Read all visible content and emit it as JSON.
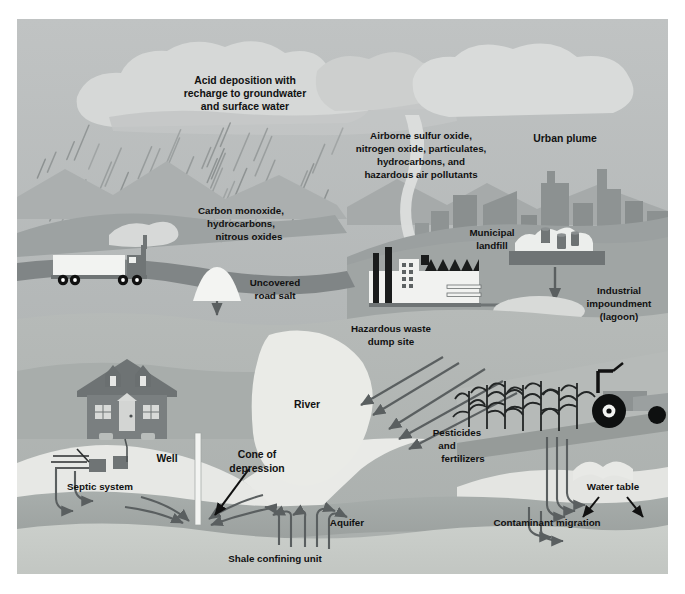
{
  "figure": {
    "border_color": "#ffffff"
  },
  "palette": {
    "sky": "#b9bcbd",
    "cloud_light": "#d5d7d6",
    "cloud_mid": "#c6c8c8",
    "mountain_far": "#a9adad",
    "mountain_mid": "#9ea2a2",
    "mountain_near": "#8f9494",
    "city_building": "#8d9292",
    "city_haze": "#d9dbda",
    "ground_surface": "#9aa09f",
    "unsaturated_zone": "#b0b5b3",
    "vadose_light": "#c3c7c5",
    "aquifer": "#a2a8a6",
    "aquifer_deep": "#949a99",
    "shale": "#c9cdc9",
    "white_feature": "#f2f3f1",
    "road": "#7f8485",
    "river": "#e9eae6",
    "arrow": "#5a5f60",
    "arrow_black": "#111111",
    "text": "#111111",
    "structure_dark": "#6f7475"
  },
  "labels": {
    "acid_deposition": [
      "Acid deposition with",
      "recharge to groundwater",
      "and surface water"
    ],
    "airborne": [
      "Airborne sulfur oxide,",
      "nitrogen oxide, particulates,",
      "hydrocarbons, and",
      "hazardous air pollutants"
    ],
    "urban_plume": "Urban plume",
    "vehicle_emissions": [
      "Carbon monoxide,",
      "hydrocarbons,",
      "nitrous oxides"
    ],
    "road_salt": [
      "Uncovered",
      "road salt"
    ],
    "municipal_landfill": [
      "Municipal",
      "landfill"
    ],
    "industrial_impoundment": [
      "Industrial",
      "impoundment",
      "(lagoon)"
    ],
    "hazardous_waste": [
      "Hazardous waste",
      "dump site"
    ],
    "septic_system": "Septic system",
    "well": "Well",
    "cone_of_depression": [
      "Cone of",
      "depression"
    ],
    "river": "River",
    "pesticides": [
      "Pesticides",
      "and",
      "fertilizers"
    ],
    "water_table": "Water table",
    "aquifer": "Aquifer",
    "contaminant_migration": "Contaminant migration",
    "shale_confining_unit": "Shale confining unit"
  },
  "features": {
    "rain_streak_count": 46,
    "cloud_count": 4,
    "city_building_count": 11,
    "waste_barrel_count": 8,
    "crop_stalk_count": 7,
    "truck_wheel_count": 4,
    "migration_arrow_count": 14
  }
}
